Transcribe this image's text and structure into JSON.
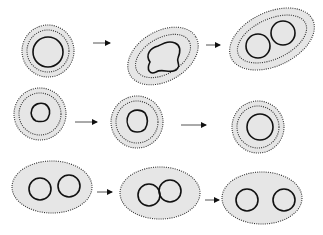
{
  "diagram": {
    "colors": {
      "fill": "#e6e6e6",
      "dotted_stroke": "#333333",
      "solid_stroke": "#111111",
      "arrow": "#555555"
    },
    "rows": [
      {
        "name": "row-1",
        "stages": [
          {
            "name": "round-cell-single-nucleus",
            "cx": 48,
            "cy": 51,
            "rx": 26,
            "ry": 26,
            "rotate": 0,
            "dotted_rings": [
              [
                26,
                26
              ],
              [
                21,
                21
              ]
            ],
            "nuclei": [
              {
                "cx": 48,
                "cy": 52,
                "r": 15
              }
            ]
          },
          {
            "name": "elongated-cell-lobed-nucleus",
            "cx": 163,
            "cy": 56,
            "rx": 38,
            "ry": 25,
            "rotate": -30,
            "dotted_rings": [
              [
                38,
                25
              ],
              [
                30,
                18
              ]
            ],
            "nuclei": []
          },
          {
            "name": "elongated-cell-two-nuclei",
            "cx": 272,
            "cy": 39,
            "rx": 45,
            "ry": 27,
            "rotate": -25,
            "dotted_rings": [
              [
                45,
                27
              ],
              [
                37,
                20
              ]
            ],
            "nuclei": [
              {
                "cx": 258,
                "cy": 46,
                "r": 12
              },
              {
                "cx": 283,
                "cy": 33,
                "r": 12
              }
            ]
          }
        ],
        "arrows": [
          {
            "x1": 93,
            "y1": 43,
            "x2": 110,
            "y2": 43
          },
          {
            "x1": 206,
            "y1": 45,
            "x2": 220,
            "y2": 45
          }
        ]
      },
      {
        "name": "row-2",
        "stages": [
          {
            "name": "round-cell-irregular-nucleus",
            "cx": 40,
            "cy": 114,
            "rx": 26,
            "ry": 26,
            "rotate": 0,
            "dotted_rings": [
              [
                26,
                26
              ],
              [
                21,
                21
              ]
            ],
            "nuclei": []
          },
          {
            "name": "round-cell-polygonal-nucleus",
            "cx": 137,
            "cy": 122,
            "rx": 26,
            "ry": 26,
            "rotate": 0,
            "dotted_rings": [
              [
                26,
                26
              ],
              [
                21,
                21
              ]
            ],
            "nuclei": []
          },
          {
            "name": "round-cell-round-nucleus",
            "cx": 258,
            "cy": 127,
            "rx": 26,
            "ry": 26,
            "rotate": 0,
            "dotted_rings": [
              [
                26,
                26
              ],
              [
                21,
                21
              ]
            ],
            "nuclei": [
              {
                "cx": 260,
                "cy": 127,
                "r": 13
              }
            ]
          }
        ],
        "arrows": [
          {
            "x1": 75,
            "y1": 122,
            "x2": 97,
            "y2": 122
          },
          {
            "x1": 181,
            "y1": 125,
            "x2": 206,
            "y2": 125
          }
        ]
      },
      {
        "name": "row-3",
        "stages": [
          {
            "name": "oval-cell-separate-nuclei",
            "cx": 52,
            "cy": 187,
            "rx": 40,
            "ry": 26,
            "rotate": 0,
            "dotted_rings": [
              [
                40,
                26
              ]
            ],
            "nuclei": [
              {
                "cx": 40,
                "cy": 189,
                "r": 11
              },
              {
                "cx": 69,
                "cy": 186,
                "r": 11
              }
            ]
          },
          {
            "name": "oval-cell-touching-nuclei",
            "cx": 160,
            "cy": 193,
            "rx": 40,
            "ry": 26,
            "rotate": 0,
            "dotted_rings": [
              [
                40,
                26
              ]
            ],
            "nuclei": [
              {
                "cx": 149,
                "cy": 195,
                "r": 11
              },
              {
                "cx": 170,
                "cy": 191,
                "r": 11
              }
            ]
          },
          {
            "name": "oval-cell-split-nuclei",
            "cx": 262,
            "cy": 198,
            "rx": 40,
            "ry": 26,
            "rotate": 0,
            "dotted_rings": [
              [
                40,
                26
              ]
            ],
            "nuclei": [
              {
                "cx": 247,
                "cy": 200,
                "r": 11
              },
              {
                "cx": 284,
                "cy": 200,
                "r": 11
              }
            ]
          }
        ],
        "arrows": [
          {
            "x1": 97,
            "y1": 192,
            "x2": 112,
            "y2": 192
          },
          {
            "x1": 205,
            "y1": 200,
            "x2": 219,
            "y2": 200
          }
        ]
      }
    ],
    "irregular_nuclei": {
      "row1_lobed": "M150,62 C145,55 150,48 158,46 C163,44 168,40 175,43 C182,46 180,53 178,58 C176,62 182,66 176,70 C170,74 162,68 156,72 C150,75 146,70 150,62 Z",
      "row2_irregular": "M32,109 C34,104 40,102 45,104 C50,107 51,113 48,118 C46,122 41,122 36,121 C32,119 30,114 32,109 Z",
      "row2_polygonal": "M129,114 C133,109 141,109 145,113 C148,118 148,124 145,129 C141,133 133,133 130,129 C127,125 126,119 129,114 Z"
    }
  }
}
